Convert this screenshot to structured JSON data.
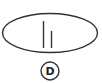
{
  "figure": {
    "option_label": "D",
    "shape": "ellipse",
    "lines": [
      {
        "name": "tall-line",
        "x": 43.5,
        "y1": 21,
        "y2": 48
      },
      {
        "name": "short-line",
        "x": 51.5,
        "y1": 31,
        "y2": 48
      }
    ],
    "colors": {
      "stroke": "#333333",
      "background": "#ffffff"
    }
  }
}
